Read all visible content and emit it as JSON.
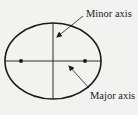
{
  "diagram": {
    "labels": {
      "minor_axis": "Minor axis",
      "major_axis": "Major axis"
    },
    "colors": {
      "background": "#f2f2f0",
      "stroke": "#1a1a1a"
    },
    "elements": [
      {
        "type": "ellipse",
        "cx": 53,
        "cy": 61,
        "rx": 48,
        "ry": 38
      },
      {
        "type": "line",
        "name": "major-axis",
        "from": [
          5,
          61
        ],
        "to": [
          101,
          61
        ]
      },
      {
        "type": "line",
        "name": "minor-axis",
        "from": [
          53,
          23
        ],
        "to": [
          53,
          99
        ]
      },
      {
        "type": "point",
        "name": "focus-left",
        "at": [
          21,
          61
        ]
      },
      {
        "type": "point",
        "name": "focus-right",
        "at": [
          85,
          61
        ]
      }
    ]
  }
}
